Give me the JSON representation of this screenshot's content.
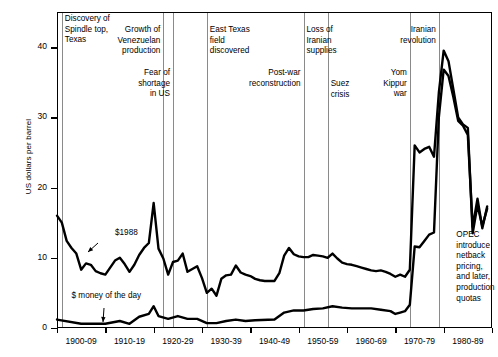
{
  "chart_data": {
    "type": "line",
    "title": "",
    "xlabel": "",
    "ylabel": "US dollars per barrel",
    "ylim": [
      0,
      45
    ],
    "yticks": [
      0,
      10,
      20,
      30,
      40
    ],
    "ytick_labels": [
      "0",
      "10",
      "20",
      "30",
      "40"
    ],
    "grid": false,
    "legend_position": "inline-callouts",
    "x_tick_labels": [
      "1900-09",
      "1910-19",
      "1920-29",
      "1930-39",
      "1940-49",
      "1950-59",
      "1960-69",
      "1970-79",
      "1980-89"
    ],
    "x_range": [
      "1900",
      "1989"
    ],
    "series": [
      {
        "name": "$1988",
        "note": "real price in constant 1988 US dollars",
        "x": [
          1900,
          1901,
          1902,
          1903,
          1904,
          1905,
          1906,
          1907,
          1908,
          1909,
          1910,
          1911,
          1912,
          1913,
          1914,
          1915,
          1916,
          1917,
          1918,
          1919,
          1920,
          1921,
          1922,
          1923,
          1924,
          1925,
          1926,
          1927,
          1928,
          1929,
          1930,
          1931,
          1932,
          1933,
          1934,
          1935,
          1936,
          1937,
          1938,
          1939,
          1940,
          1941,
          1942,
          1943,
          1944,
          1945,
          1946,
          1947,
          1948,
          1949,
          1950,
          1951,
          1952,
          1953,
          1954,
          1955,
          1956,
          1957,
          1958,
          1959,
          1960,
          1961,
          1962,
          1963,
          1964,
          1965,
          1966,
          1967,
          1968,
          1969,
          1970,
          1971,
          1972,
          1973,
          1974,
          1975,
          1976,
          1977,
          1978,
          1979,
          1980,
          1981,
          1982,
          1983,
          1984,
          1985,
          1986,
          1987,
          1988,
          1989
        ],
        "values": [
          16.0,
          15.0,
          12.4,
          11.4,
          10.6,
          8.3,
          9.2,
          9.0,
          8.1,
          7.8,
          7.6,
          8.6,
          9.6,
          10.0,
          9.1,
          8.0,
          9.0,
          10.4,
          11.4,
          12.1,
          17.8,
          11.3,
          9.9,
          7.6,
          9.4,
          9.6,
          10.6,
          8.0,
          8.4,
          8.8,
          7.1,
          5.0,
          5.6,
          4.6,
          7.0,
          7.5,
          7.6,
          8.9,
          7.9,
          7.6,
          7.4,
          7.0,
          6.8,
          6.7,
          6.7,
          6.7,
          7.8,
          10.3,
          11.4,
          10.5,
          10.2,
          10.1,
          10.1,
          10.4,
          10.3,
          10.2,
          10.0,
          10.6,
          9.9,
          9.3,
          9.1,
          9.0,
          8.8,
          8.6,
          8.4,
          8.2,
          8.1,
          8.2,
          8.0,
          7.7,
          7.3,
          7.6,
          7.3,
          8.3,
          26.0,
          25.0,
          25.5,
          25.8,
          24.4,
          33.5,
          39.5,
          38.0,
          34.0,
          30.0,
          29.0,
          28.5,
          13.5,
          17.5,
          14.5,
          17.0
        ]
      },
      {
        "name": "$ money of the day",
        "note": "nominal price of the day",
        "x": [
          1900,
          1905,
          1910,
          1913,
          1915,
          1917,
          1919,
          1920,
          1921,
          1923,
          1925,
          1927,
          1929,
          1931,
          1933,
          1935,
          1937,
          1939,
          1941,
          1945,
          1947,
          1949,
          1951,
          1953,
          1955,
          1957,
          1959,
          1961,
          1963,
          1965,
          1967,
          1969,
          1970,
          1971,
          1972,
          1973,
          1974,
          1975,
          1976,
          1977,
          1978,
          1979,
          1980,
          1981,
          1982,
          1983,
          1984,
          1985,
          1986,
          1987,
          1988,
          1989
        ],
        "values": [
          1.2,
          0.6,
          0.6,
          1.0,
          0.6,
          1.6,
          2.0,
          3.1,
          1.7,
          1.3,
          1.7,
          1.3,
          1.3,
          0.7,
          0.7,
          1.0,
          1.2,
          1.0,
          1.1,
          1.2,
          2.2,
          2.5,
          2.5,
          2.7,
          2.8,
          3.1,
          2.9,
          2.8,
          2.8,
          2.8,
          2.6,
          2.4,
          2.0,
          2.2,
          2.4,
          3.3,
          11.6,
          11.5,
          12.4,
          13.3,
          13.6,
          30.0,
          36.8,
          35.9,
          32.9,
          29.5,
          28.8,
          27.5,
          14.4,
          18.4,
          14.2,
          17.3
        ]
      }
    ],
    "series_callouts": [
      {
        "label": "$1988",
        "x_year": 1912,
        "y_value": 13.5
      },
      {
        "label": "$ money of the day",
        "x_year": 1903,
        "y_value": 4.6
      }
    ],
    "annotations": [
      {
        "text": "Discovery of\nSpindle top,\nTexas",
        "x_year": 1901,
        "align": "left",
        "top_px": 14,
        "rule": true
      },
      {
        "text": "Growth of\nVenezuelan\nproduction",
        "x_year": 1922,
        "align": "right",
        "top_px": 25,
        "rule": true
      },
      {
        "text": "Fear of\nshortage\nin US",
        "x_year": 1924,
        "align": "right",
        "top_px": 68,
        "rule": true
      },
      {
        "text": "East Texas\nfield\ndiscovered",
        "x_year": 1931,
        "align": "left",
        "top_px": 25,
        "rule": true
      },
      {
        "text": "Post-war\nreconstruction",
        "x_year": 1951,
        "align": "right",
        "top_px": 68,
        "rule": true
      },
      {
        "text": "Loss of\nIranian\nsupplies",
        "x_year": 1951,
        "align": "left",
        "top_px": 25,
        "rule": false
      },
      {
        "text": "Suez\ncrisis",
        "x_year": 1956,
        "align": "left",
        "top_px": 79,
        "rule": true
      },
      {
        "text": "Yom\nKippur\nwar",
        "x_year": 1973,
        "align": "right",
        "top_px": 68,
        "rule": true
      },
      {
        "text": "Iranian\nrevolution",
        "x_year": 1979,
        "align": "right",
        "top_px": 25,
        "rule": true
      },
      {
        "text": "OPEC\nintroduce\nnetback\npricing,\nand later,\nproduction\nquotas",
        "x_year": 1982,
        "align": "left",
        "top_px": 230,
        "rule": false
      }
    ]
  }
}
